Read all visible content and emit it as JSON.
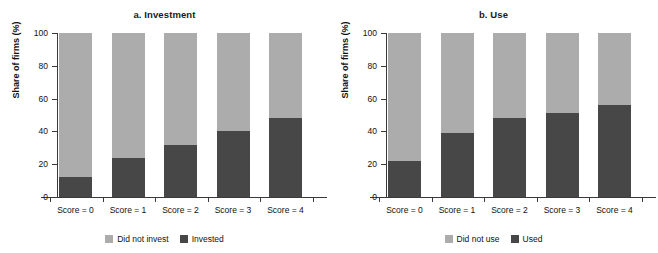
{
  "figure": {
    "panels": [
      {
        "id": "investment",
        "title": "a. Investment",
        "ylabel": "Share of firms (%)",
        "legend": [
          {
            "label": "Did not invest",
            "color": "#ACACAC"
          },
          {
            "label": "Invested",
            "color": "#474747"
          }
        ]
      },
      {
        "id": "use",
        "title": "b. Use",
        "ylabel": "Share of firms (%)",
        "legend": [
          {
            "label": "Did not use",
            "color": "#ACACAC"
          },
          {
            "label": "Used",
            "color": "#474747"
          }
        ]
      }
    ]
  },
  "chart_data": [
    {
      "type": "bar",
      "subtype": "stacked-100",
      "title": "a. Investment",
      "xlabel": "",
      "ylabel": "Share of firms (%)",
      "ylim": [
        0,
        100
      ],
      "yticks": [
        0,
        20,
        40,
        60,
        80,
        100
      ],
      "ytick_labels": [
        "0",
        "20",
        "40",
        "60",
        "80",
        "100"
      ],
      "grid": false,
      "legend_position": "bottom-center",
      "categories": [
        "Score = 0",
        "Score = 1",
        "Score = 2",
        "Score = 3",
        "Score = 4"
      ],
      "series": [
        {
          "name": "Invested",
          "color": "#474747",
          "values": [
            12,
            24,
            32,
            40,
            48
          ]
        },
        {
          "name": "Did not invest",
          "color": "#ACACAC",
          "values": [
            88,
            76,
            68,
            60,
            52
          ]
        }
      ]
    },
    {
      "type": "bar",
      "subtype": "stacked-100",
      "title": "b. Use",
      "xlabel": "",
      "ylabel": "Share of firms (%)",
      "ylim": [
        0,
        100
      ],
      "yticks": [
        0,
        20,
        40,
        60,
        80,
        100
      ],
      "ytick_labels": [
        "0",
        "20",
        "40",
        "60",
        "80",
        "100"
      ],
      "grid": false,
      "legend_position": "bottom-center",
      "categories": [
        "Score = 0",
        "Score = 1",
        "Score = 2",
        "Score = 3",
        "Score = 4"
      ],
      "series": [
        {
          "name": "Used",
          "color": "#474747",
          "values": [
            22,
            39,
            48,
            51,
            56
          ]
        },
        {
          "name": "Did not use",
          "color": "#ACACAC",
          "values": [
            78,
            61,
            52,
            49,
            44
          ]
        }
      ]
    }
  ]
}
